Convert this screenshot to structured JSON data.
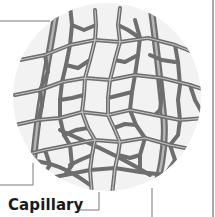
{
  "diagram": {
    "labels": [
      {
        "id": "capillary",
        "text": "Capillary"
      }
    ],
    "colors": {
      "background": "#ffffff",
      "circle_fill": "#f2f2f2",
      "vessel": "#6e6e6e",
      "vessel_highlight": "#a9a9a9",
      "leader_line": "#7a7a7a",
      "border_line": "#8c8c8c",
      "label_text": "#1a1a1a"
    }
  }
}
